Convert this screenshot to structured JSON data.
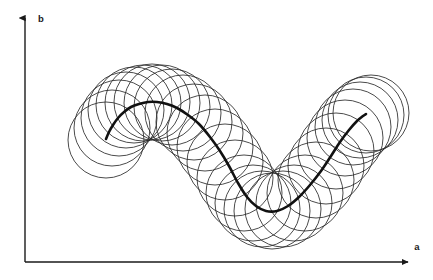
{
  "figure": {
    "title": "",
    "background_color": "#ffffff",
    "width": 433,
    "height": 280
  },
  "axes": {
    "x_axis": {
      "label": "a",
      "label_x": 417,
      "label_y": 248,
      "start_x": 25,
      "start_y": 262,
      "end_x": 411,
      "end_y": 262,
      "color": "#1a1a1a",
      "arrow": "arrow-right"
    },
    "y_axis": {
      "label": "b",
      "label_x": 41,
      "label_y": 19,
      "start_x": 25,
      "start_y": 262,
      "end_x": 25,
      "end_y": 15,
      "color": "#1a1a1a",
      "arrow": "arrow-up"
    }
  },
  "chart_data": {
    "type": "line",
    "title": "",
    "xlabel": "a",
    "ylabel": "b",
    "grid": false,
    "legend": null,
    "curve": {
      "name": "sine-wave",
      "description": "thick sinusoidal curve with one crest on the left and one crest on the right separated by a trough",
      "color": "#111111",
      "stroke_width": 2.6,
      "amplitude_px": 55,
      "center_y_px": 157,
      "crest_y_px": 102,
      "trough_y_px": 212,
      "period_px": 218,
      "phase_start_deg": 200,
      "phase_end_deg": 560,
      "t_start": 0.0,
      "t_end": 1.0,
      "x_start_px": 106,
      "x_end_px": 366,
      "points_x": [
        106,
        109,
        113,
        118,
        124,
        131,
        139,
        148,
        157,
        167,
        177,
        188,
        199,
        210,
        220,
        229,
        238,
        247,
        256,
        266,
        277,
        288,
        299,
        310,
        321,
        331,
        340,
        349,
        357,
        363,
        366
      ],
      "points_y": [
        139,
        132,
        125,
        118,
        112,
        107,
        104,
        102,
        102,
        104,
        108,
        115,
        124,
        137,
        151,
        166,
        183,
        197,
        206,
        211,
        211,
        206,
        197,
        185,
        171,
        156,
        142,
        130,
        121,
        116,
        114
      ]
    },
    "circles": {
      "name": "equal-radius-circle-family",
      "description": "family of equal-radius circles centered on successive points along the sine curve, producing an envelope caustic converging at the crest and trough",
      "radius_px": 38,
      "count": 30,
      "stroke_color": "#2b2b2b",
      "stroke_width": 0.85,
      "fill": "none",
      "centers_x": [
        106,
        112,
        119,
        126,
        134,
        143,
        152,
        162,
        172,
        183,
        194,
        205,
        215,
        225,
        235,
        244,
        253,
        262,
        272,
        283,
        294,
        305,
        316,
        326,
        336,
        345,
        353,
        360,
        366,
        371
      ],
      "centers_y": [
        140,
        128,
        118,
        110,
        105,
        103,
        102,
        103,
        107,
        113,
        122,
        133,
        147,
        162,
        178,
        193,
        203,
        209,
        211,
        209,
        203,
        193,
        180,
        166,
        151,
        138,
        127,
        120,
        115,
        113
      ]
    },
    "focal_points": [
      {
        "name": "left-crest-focus",
        "x": 120,
        "y": 102
      },
      {
        "name": "right-crest-focus",
        "x": 337,
        "y": 118
      }
    ],
    "xlim_px": [
      25,
      411
    ],
    "ylim_px": [
      262,
      15
    ]
  }
}
